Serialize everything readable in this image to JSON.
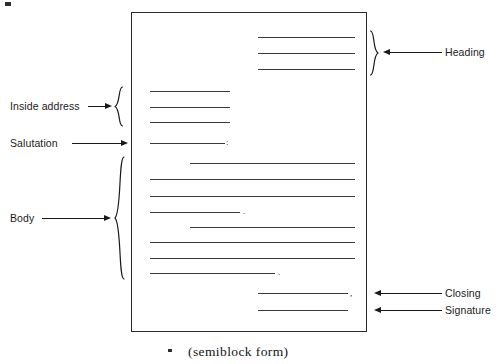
{
  "figure": {
    "caption": "(semiblock form)",
    "document_type": "business-letter-format-diagram"
  },
  "labels": {
    "heading": "Heading",
    "inside_address": "Inside address",
    "salutation": "Salutation",
    "body": "Body",
    "closing": "Closing",
    "signature": "Signature"
  },
  "punctuation": {
    "salutation_colon": ":",
    "closing_comma": ",",
    "body_period_1": ".",
    "body_period_2": "."
  },
  "colors": {
    "ink": "#1a1a1a",
    "rule": "#3a3a3a",
    "border": "#2b2b2b",
    "page": "#ffffff"
  },
  "page_layout": {
    "box": {
      "left": 131,
      "top": 12,
      "width": 236,
      "height": 320
    },
    "sections": [
      {
        "name": "heading",
        "rules": [
          {
            "x": 258,
            "y": 37,
            "w": 97
          },
          {
            "x": 258,
            "y": 53,
            "w": 97
          },
          {
            "x": 258,
            "y": 69,
            "w": 97
          }
        ]
      },
      {
        "name": "inside-address",
        "rules": [
          {
            "x": 150,
            "y": 91,
            "w": 80
          },
          {
            "x": 150,
            "y": 107,
            "w": 80
          },
          {
            "x": 150,
            "y": 122,
            "w": 80
          }
        ]
      },
      {
        "name": "salutation",
        "rules": [
          {
            "x": 150,
            "y": 143,
            "w": 75
          }
        ]
      },
      {
        "name": "body",
        "rules": [
          {
            "x": 190,
            "y": 163,
            "w": 165
          },
          {
            "x": 150,
            "y": 179,
            "w": 205
          },
          {
            "x": 150,
            "y": 196,
            "w": 205
          },
          {
            "x": 150,
            "y": 212,
            "w": 90
          },
          {
            "x": 190,
            "y": 227,
            "w": 165
          },
          {
            "x": 150,
            "y": 242,
            "w": 205
          },
          {
            "x": 150,
            "y": 258,
            "w": 205
          },
          {
            "x": 150,
            "y": 273,
            "w": 125
          }
        ]
      },
      {
        "name": "closing",
        "rules": [
          {
            "x": 258,
            "y": 293,
            "w": 90
          }
        ]
      },
      {
        "name": "signature",
        "rules": [
          {
            "x": 258,
            "y": 310,
            "w": 90
          }
        ]
      }
    ]
  }
}
